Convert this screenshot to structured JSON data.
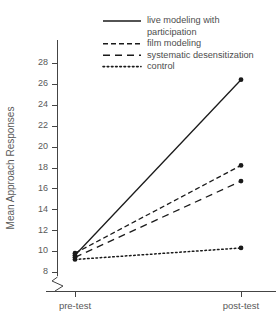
{
  "chart_data": {
    "type": "line",
    "title": "",
    "xlabel": "",
    "ylabel": "Mean Approach Responses",
    "categories": [
      "pre-test",
      "post-test"
    ],
    "x": [
      0,
      1
    ],
    "ylim": [
      8,
      29
    ],
    "yticks": [
      8,
      10,
      12,
      14,
      16,
      18,
      20,
      22,
      24,
      26,
      28
    ],
    "ytick_labels": [
      "8",
      "10",
      "12",
      "14",
      "16",
      "18",
      "20",
      "22",
      "24",
      "26",
      "28"
    ],
    "xtick_labels": [
      "pre-test",
      "post-test"
    ],
    "grid": false,
    "axis_break": true,
    "axis_break_note": "zigzag break on y-axis below value 8",
    "legend_position": "top-right",
    "marker": "filled-circle",
    "series": [
      {
        "name": "live modeling with participation",
        "label_lines": [
          "live modeling with",
          "participation"
        ],
        "linestyle": "solid",
        "values": [
          9.6,
          26.4
        ],
        "color": "#1a1a1a"
      },
      {
        "name": "film modeling",
        "label_lines": [
          "film modeling"
        ],
        "linestyle": "dashed",
        "values": [
          9.8,
          18.2
        ],
        "color": "#1a1a1a"
      },
      {
        "name": "systematic desensitization",
        "label_lines": [
          "systematic desensitization"
        ],
        "linestyle": "longdash",
        "values": [
          9.4,
          16.7
        ],
        "color": "#1a1a1a"
      },
      {
        "name": "control",
        "label_lines": [
          "control"
        ],
        "linestyle": "dotted",
        "values": [
          9.2,
          10.3
        ],
        "color": "#1a1a1a"
      }
    ]
  },
  "axes": {
    "y_title": "Mean Approach Responses"
  },
  "colors": {
    "ink": "#1a1a1a",
    "axis": "#444444",
    "text": "#595959",
    "background": "#ffffff"
  }
}
